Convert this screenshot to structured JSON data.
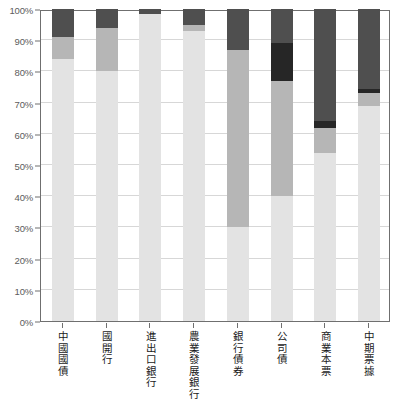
{
  "chart_data": {
    "type": "bar",
    "subtype": "stacked-bar-100-percent",
    "title": "",
    "subtitle": "",
    "xlabel": "",
    "ylabel": "",
    "ylim": [
      0,
      100
    ],
    "grid": true,
    "legend": "none",
    "categories": [
      "中國國債",
      "國開行",
      "進出口銀行",
      "農業發展銀行",
      "銀行債券",
      "公司債",
      "商業本票",
      "中期票據"
    ],
    "y_tick_labels": [
      "0%",
      "10%",
      "20%",
      "30%",
      "40%",
      "50%",
      "60%",
      "70%",
      "80%",
      "90%",
      "100%"
    ],
    "y_tick_values": [
      0,
      10,
      20,
      30,
      40,
      50,
      60,
      70,
      80,
      90,
      100
    ],
    "series": [
      {
        "name": "series-1",
        "color": "#e3e3e3",
        "values": [
          84,
          80,
          98.5,
          93,
          30,
          40,
          54,
          69
        ]
      },
      {
        "name": "series-2",
        "color": "#b6b6b6",
        "values": [
          7,
          14,
          0,
          2,
          57,
          37,
          8,
          4
        ]
      },
      {
        "name": "series-3",
        "color": "#767676",
        "values": [
          0,
          0,
          0,
          0,
          0,
          0,
          0,
          0
        ]
      },
      {
        "name": "series-4",
        "color": "#262626",
        "values": [
          0,
          0,
          0,
          0,
          0,
          12,
          2,
          1.5
        ]
      },
      {
        "name": "series-5",
        "color": "#4f4f4f",
        "values": [
          9,
          6,
          1.5,
          5,
          13,
          11,
          36,
          25.5
        ]
      }
    ],
    "stack_order_bottom_to_top": [
      "series-1",
      "series-2",
      "series-3",
      "series-4",
      "series-5"
    ],
    "colors": {
      "lightest": "#e3e3e3",
      "light_mid": "#b6b6b6",
      "mid": "#767676",
      "darkest": "#262626",
      "dark": "#4f4f4f",
      "gridline": "#d7d7d7",
      "axis": "#6f6f6f",
      "tick_text": "#5c5c5c",
      "label_text": "#1a1a1a",
      "background": "#ffffff"
    }
  }
}
